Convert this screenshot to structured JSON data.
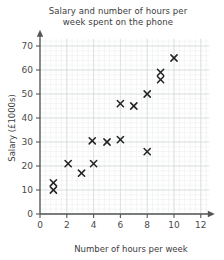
{
  "chart_data": {
    "type": "scatter",
    "title": "Salary and number of hours per week spent on the phone",
    "title_line1": "Salary and number of hours per",
    "title_line2": "week spent on the phone",
    "xlabel": "Number of hours per week",
    "ylabel": "Salary (£1000s)",
    "xlim": [
      0,
      12.6
    ],
    "ylim": [
      0,
      73
    ],
    "xticks": [
      0,
      2,
      4,
      6,
      8,
      10,
      12
    ],
    "xtick_labels": [
      "0",
      "2",
      "4",
      "6",
      "8",
      "10",
      "12"
    ],
    "yticks": [
      0,
      10,
      20,
      30,
      40,
      50,
      60,
      70
    ],
    "ytick_labels": [
      "0",
      "10",
      "20",
      "30",
      "40",
      "50",
      "60",
      "70"
    ],
    "grid": true,
    "grid_major_color": "#d6dbd9",
    "grid_minor_color": "#ecefee",
    "axis_color": "#555555",
    "marker": "x-cross",
    "marker_color": "#222222",
    "legend": null,
    "points": [
      {
        "x": 1.0,
        "y": 10
      },
      {
        "x": 1.0,
        "y": 13
      },
      {
        "x": 2.1,
        "y": 21
      },
      {
        "x": 3.1,
        "y": 17
      },
      {
        "x": 4.0,
        "y": 21
      },
      {
        "x": 5.0,
        "y": 30
      },
      {
        "x": 6.0,
        "y": 31
      },
      {
        "x": 6.0,
        "y": 46
      },
      {
        "x": 7.0,
        "y": 45
      },
      {
        "x": 8.0,
        "y": 26
      },
      {
        "x": 8.0,
        "y": 50
      },
      {
        "x": 9.0,
        "y": 56
      },
      {
        "x": 9.0,
        "y": 59
      },
      {
        "x": 10.0,
        "y": 65
      },
      {
        "x": 3.9,
        "y": 30.5
      }
    ]
  }
}
